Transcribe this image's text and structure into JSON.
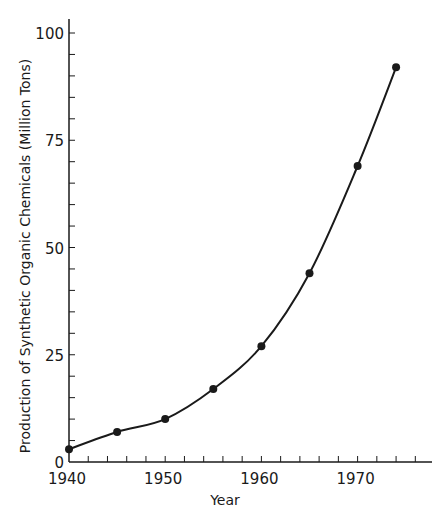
{
  "chart_data": {
    "type": "line",
    "title": "",
    "xlabel": "Year",
    "ylabel": "Production of Synthetic Organic Chemicals (Million Tons)",
    "x": [
      1940,
      1945,
      1950,
      1955,
      1960,
      1965,
      1970,
      1974
    ],
    "series": [
      {
        "name": "Production",
        "values": [
          3,
          7,
          10,
          17,
          27,
          44,
          69,
          92
        ]
      }
    ],
    "xlim": [
      1940,
      1977
    ],
    "ylim": [
      0,
      100
    ],
    "x_ticks": [
      1940,
      1950,
      1960,
      1970
    ],
    "x_tick_labels": [
      "1940",
      "1950",
      "1960",
      "1970"
    ],
    "x_minor_step": 2,
    "y_ticks": [
      0,
      25,
      50,
      75,
      100
    ],
    "y_tick_labels": [
      "0",
      "25",
      "50",
      "75",
      "100"
    ],
    "y_minor_step": 5,
    "grid": false,
    "legend": null,
    "markers": "filled-circle",
    "line_color": "#1a1a1a"
  }
}
